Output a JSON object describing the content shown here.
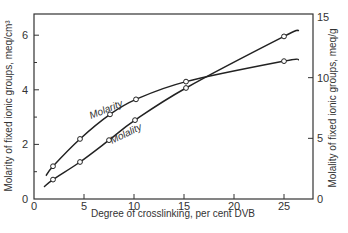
{
  "chart_data": {
    "type": "line",
    "title": "",
    "xlabel": "Degree of crosslinking, per cent DVB",
    "ylabel": "Molarity of fixed ionic groups, meq/cm³",
    "y2label": "Molality of fixed ionic groups, meq/g",
    "xlim": [
      0,
      28
    ],
    "ylim": [
      0,
      6.8
    ],
    "y2lim": [
      0,
      15
    ],
    "x_ticks": [
      0,
      5,
      10,
      15,
      20,
      25
    ],
    "y_ticks": [
      0,
      2,
      4,
      6
    ],
    "y_minor_ticks": [
      1,
      3,
      5
    ],
    "y2_ticks": [
      0,
      5,
      10,
      15
    ],
    "grid": false,
    "legend": "inline curve labels",
    "series": [
      {
        "name": "Molarity",
        "axis": "left",
        "x": [
          1.9,
          4.6,
          7.6,
          10.2,
          15.2,
          25.0
        ],
        "values": [
          1.2,
          2.2,
          3.1,
          3.65,
          4.3,
          5.05
        ],
        "curve_start": [
          1.2,
          0.85
        ],
        "curve_end": [
          26.5,
          5.1
        ]
      },
      {
        "name": "Molality",
        "axis": "right",
        "x": [
          1.9,
          4.6,
          7.5,
          10.1,
          15.2,
          25.0
        ],
        "values": [
          1.6,
          3.05,
          4.85,
          6.5,
          9.15,
          13.4
        ],
        "curve_start": [
          1.0,
          1.0
        ],
        "curve_end": [
          26.5,
          13.9
        ]
      }
    ]
  },
  "labels": {
    "x_axis_title": "Degree of crosslinking,  per cent DVB",
    "y_left_title": "Molarity of fixed ionic groups, meq/cm³",
    "y_right_title": "Molality of fixed ionic groups, meq/g",
    "molarity_label": "Molarity",
    "molality_label": "Molality"
  }
}
